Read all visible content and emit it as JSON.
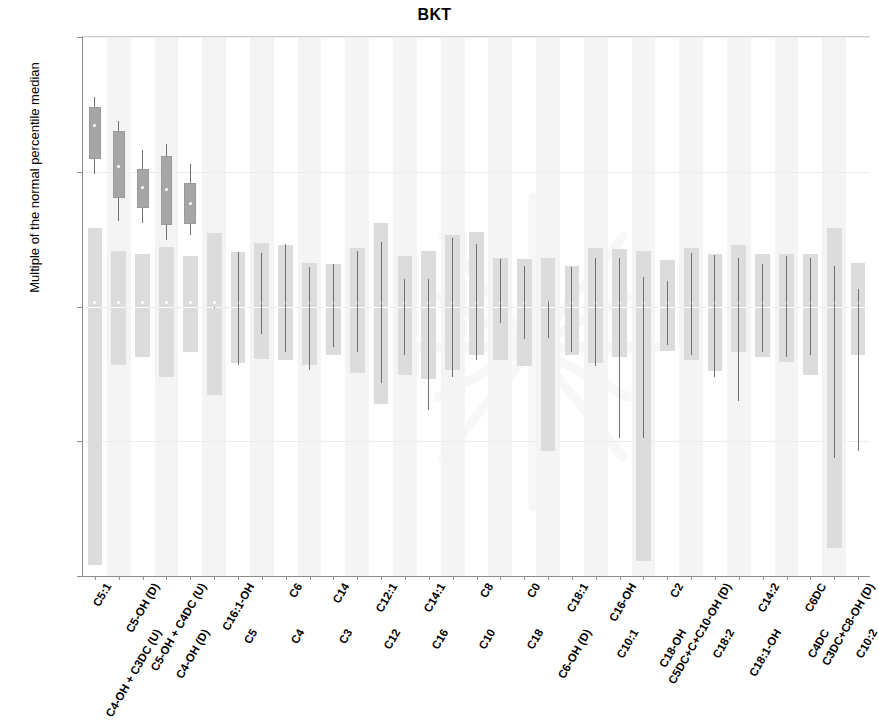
{
  "chart_data": {
    "type": "box",
    "title": "BKT",
    "xlabel": "",
    "ylabel": "Multiple of the normal percentile median",
    "yscale": "log",
    "ylim": [
      0.01,
      100.0
    ],
    "yticks": [
      100.0,
      10.0,
      1.0,
      0.1,
      0.01
    ],
    "ytick_labels": [
      "100.00",
      "10.00",
      "1.00",
      "0.10",
      "0.01"
    ],
    "grid": false,
    "legend": "none",
    "categories": [
      "C5:1",
      "C4-OH + C3DC (U)",
      "C5-OH (D)",
      "C4-OH (D)",
      "C5-OH + C4DC (U)",
      "C5",
      "C16:1-OH",
      "C4",
      "C6",
      "C3",
      "C14",
      "C12",
      "C12:1",
      "C16",
      "C14:1",
      "C10",
      "C8",
      "C18",
      "C0",
      "C6-OH (D)",
      "C18:1",
      "C10:1",
      "C16-OH",
      "C18-OH",
      "C2",
      "C18:2",
      "C5DC+C+C10-OH (D)",
      "C18:1-OH",
      "C14:2",
      "C4DC",
      "C6DC",
      "C10:2",
      "C3DC+C8-OH (D)"
    ],
    "series": [
      {
        "name": "reference range band",
        "color": "#dcdcdc",
        "bands": [
          {
            "low": 0.012,
            "high": 3.8
          },
          {
            "low": 0.37,
            "high": 2.6
          },
          {
            "low": 0.42,
            "high": 2.45
          },
          {
            "low": 0.3,
            "high": 2.75
          },
          {
            "low": 0.46,
            "high": 2.35
          },
          {
            "low": 0.22,
            "high": 3.5
          },
          {
            "low": 0.38,
            "high": 2.55
          },
          {
            "low": 0.41,
            "high": 2.95
          },
          {
            "low": 0.4,
            "high": 2.85
          },
          {
            "low": 0.37,
            "high": 2.1
          },
          {
            "low": 0.44,
            "high": 2.05
          },
          {
            "low": 0.32,
            "high": 2.7
          },
          {
            "low": 0.19,
            "high": 4.2
          },
          {
            "low": 0.31,
            "high": 2.35
          },
          {
            "low": 0.29,
            "high": 2.6
          },
          {
            "low": 0.34,
            "high": 3.4
          },
          {
            "low": 0.44,
            "high": 3.6
          },
          {
            "low": 0.4,
            "high": 2.3
          },
          {
            "low": 0.36,
            "high": 2.25
          },
          {
            "low": 0.085,
            "high": 2.3
          },
          {
            "low": 0.44,
            "high": 2.0
          },
          {
            "low": 0.38,
            "high": 2.7
          },
          {
            "low": 0.42,
            "high": 2.65
          },
          {
            "low": 0.013,
            "high": 2.6
          },
          {
            "low": 0.47,
            "high": 2.2
          },
          {
            "low": 0.4,
            "high": 2.7
          },
          {
            "low": 0.33,
            "high": 2.45
          },
          {
            "low": 0.46,
            "high": 2.85
          },
          {
            "low": 0.42,
            "high": 2.45
          },
          {
            "low": 0.39,
            "high": 2.45
          },
          {
            "low": 0.31,
            "high": 2.45
          },
          {
            "low": 0.016,
            "high": 3.85
          },
          {
            "low": 0.44,
            "high": 2.1
          }
        ]
      },
      {
        "name": "BKT cohort box",
        "color": "#a6a6a6",
        "boxes": [
          {
            "q1": 12.5,
            "median": 22.0,
            "q3": 30.0,
            "lower": 9.7,
            "upper": 36.0
          },
          {
            "q1": 6.4,
            "median": 11.0,
            "q3": 20.0,
            "lower": 4.3,
            "upper": 24.0
          },
          {
            "q1": 5.4,
            "median": 7.6,
            "q3": 10.5,
            "lower": 4.2,
            "upper": 14.5
          },
          {
            "q1": 4.0,
            "median": 7.4,
            "q3": 13.0,
            "lower": 3.1,
            "upper": 16.0
          },
          {
            "q1": 4.1,
            "median": 5.8,
            "q3": 8.3,
            "lower": 3.4,
            "upper": 11.5
          },
          {
            "q1": 0.0,
            "median": 1.0,
            "q3": 0.0,
            "lower": 0.0,
            "upper": 0.0
          }
        ]
      },
      {
        "name": "whisker lines (cohort, log range)",
        "color": "#6f6f6f",
        "ranges": [
          {
            "cat": "C5",
            "low": 1.0,
            "high": 1.0
          },
          {
            "cat": "C16:1-OH",
            "low": 0.37,
            "high": 2.55
          },
          {
            "cat": "C4",
            "low": 0.63,
            "high": 2.5
          },
          {
            "cat": "C6",
            "low": 0.46,
            "high": 2.9
          },
          {
            "cat": "C3",
            "low": 0.34,
            "high": 1.95
          },
          {
            "cat": "C14",
            "low": 0.5,
            "high": 2.05
          },
          {
            "cat": "C12",
            "low": 0.46,
            "high": 2.6
          },
          {
            "cat": "C12:1",
            "low": 0.27,
            "high": 3.0
          },
          {
            "cat": "C16",
            "low": 0.44,
            "high": 1.6
          },
          {
            "cat": "C14:1",
            "low": 0.17,
            "high": 1.6
          },
          {
            "cat": "C10",
            "low": 0.3,
            "high": 3.2
          },
          {
            "cat": "C8",
            "low": 0.4,
            "high": 2.9
          },
          {
            "cat": "C18",
            "low": 0.75,
            "high": 2.25
          },
          {
            "cat": "C0",
            "low": 0.57,
            "high": 2.0
          },
          {
            "cat": "C6-OH (D)",
            "low": 0.58,
            "high": 1.1
          },
          {
            "cat": "C18:1",
            "low": 0.46,
            "high": 1.95
          },
          {
            "cat": "C10:1",
            "low": 0.36,
            "high": 2.3
          },
          {
            "cat": "C16-OH",
            "low": 0.105,
            "high": 2.3
          },
          {
            "cat": "C18-OH",
            "low": 0.105,
            "high": 1.65
          },
          {
            "cat": "C2",
            "low": 0.52,
            "high": 1.55
          },
          {
            "cat": "C18:2",
            "low": 0.44,
            "high": 2.5
          },
          {
            "cat": "C5DC+C+C10-OH (D)",
            "low": 0.3,
            "high": 2.4
          },
          {
            "cat": "C18:1-OH",
            "low": 0.2,
            "high": 2.3
          },
          {
            "cat": "C14:2",
            "low": 0.46,
            "high": 2.05
          },
          {
            "cat": "C4DC",
            "low": 0.42,
            "high": 2.35
          },
          {
            "cat": "C6DC",
            "low": 0.44,
            "high": 2.3
          },
          {
            "cat": "C10:2",
            "low": 0.075,
            "high": 2.0
          },
          {
            "cat": "C3DC+C8-OH (D)",
            "low": 0.085,
            "high": 1.35
          }
        ]
      }
    ]
  },
  "axis": {
    "y_tick_labels": [
      "100.00",
      "10.00",
      "1.00",
      "0.10",
      "0.01"
    ]
  }
}
